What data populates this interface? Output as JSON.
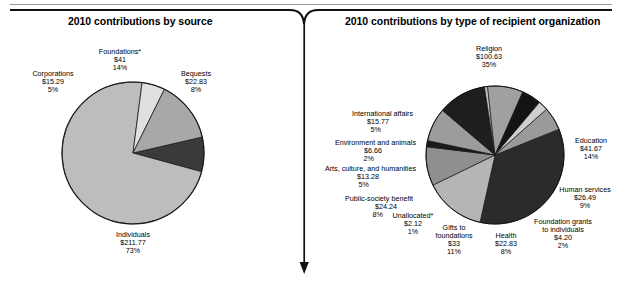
{
  "figure": {
    "divider_arrow": "down-arrow-divider"
  },
  "charts": [
    {
      "id": "contributions-by-source",
      "title": "2010 contributions by source",
      "labels": [
        {
          "name": "foundations",
          "lines": [
            "Foundations*",
            "$41",
            "14%"
          ]
        },
        {
          "name": "bequests",
          "lines": [
            "Bequests",
            "$22.83",
            "8%"
          ]
        },
        {
          "name": "corporations",
          "lines": [
            "Corporations",
            "$15.29",
            "5%"
          ]
        },
        {
          "name": "individuals",
          "lines": [
            "Individuals",
            "$211.77",
            "73%"
          ]
        }
      ]
    },
    {
      "id": "contributions-by-recipient-type",
      "title": "2010 contributions by type of recipient organization",
      "labels": [
        {
          "name": "religion",
          "lines": [
            "Religion",
            "$100.63",
            "35%"
          ]
        },
        {
          "name": "education",
          "lines": [
            "Education",
            "$41.67",
            "14%"
          ]
        },
        {
          "name": "human-services",
          "lines": [
            "Human services",
            "$26.49",
            "9%"
          ]
        },
        {
          "name": "foundation-grants-to-individuals",
          "lines": [
            "Foundation grants",
            "to individuals",
            "$4.20",
            "2%"
          ]
        },
        {
          "name": "health",
          "lines": [
            "Health",
            "$22.83",
            "8%"
          ]
        },
        {
          "name": "gifts-to-foundations",
          "lines": [
            "Gifts to",
            "foundations",
            "$33",
            "11%"
          ]
        },
        {
          "name": "unallocated",
          "lines": [
            "Unallocated*",
            "$2.12",
            "1%"
          ]
        },
        {
          "name": "public-society-benefit",
          "lines": [
            "Public-society benefit",
            "$24.24",
            "8%"
          ]
        },
        {
          "name": "arts-culture-humanities",
          "lines": [
            "Arts, culture, and humanities",
            "$13.28",
            "5%"
          ]
        },
        {
          "name": "environment-and-animals",
          "lines": [
            "Environment and animals",
            "$6.66",
            "2%"
          ]
        },
        {
          "name": "international-affairs",
          "lines": [
            "International affairs",
            "$15.77",
            "5%"
          ]
        }
      ]
    }
  ],
  "chart_data": [
    {
      "type": "pie",
      "title": "2010 contributions by source",
      "units": "billions of dollars",
      "start_angle_deg": -13,
      "direction": "clockwise",
      "categories": [
        "Bequests",
        "Individuals",
        "Corporations",
        "Foundations*"
      ],
      "values": [
        22.83,
        211.77,
        15.29,
        41.0
      ],
      "percents": [
        8,
        73,
        5,
        14
      ],
      "value_labels": [
        "$22.83",
        "$211.77",
        "$15.29",
        "$41"
      ],
      "percent_labels": [
        "8%",
        "73%",
        "5%",
        "14%"
      ],
      "colors": [
        "#3a3a3a",
        "#bdbdbd",
        "#e0e0e0",
        "#a8a8a8"
      ],
      "legend": "none",
      "footnote_marker": "*"
    },
    {
      "type": "pie",
      "title": "2010 contributions by type of recipient organization",
      "units": "billions of dollars",
      "start_angle_deg": -22,
      "direction": "clockwise",
      "categories": [
        "Religion",
        "Education",
        "Human services",
        "Foundation grants to individuals",
        "Health",
        "Gifts to foundations",
        "Unallocated*",
        "Public-society benefit",
        "Arts, culture, and humanities",
        "Environment and animals",
        "International affairs"
      ],
      "values": [
        100.63,
        41.67,
        26.49,
        4.2,
        22.83,
        33.0,
        2.12,
        24.24,
        13.28,
        6.66,
        15.77
      ],
      "percents": [
        35,
        14,
        9,
        2,
        8,
        11,
        1,
        8,
        5,
        2,
        5
      ],
      "value_labels": [
        "$100.63",
        "$41.67",
        "$26.49",
        "$4.20",
        "$22.83",
        "$33",
        "$2.12",
        "$24.24",
        "$13.28",
        "$6.66",
        "$15.77"
      ],
      "percent_labels": [
        "35%",
        "14%",
        "9%",
        "2%",
        "8%",
        "11%",
        "1%",
        "8%",
        "5%",
        "2%",
        "5%"
      ],
      "colors": [
        "#2b2b2b",
        "#b5b5b5",
        "#8f8f8f",
        "#1a1a1a",
        "#9c9c9c",
        "#1e1e1e",
        "#c6c6c6",
        "#a0a0a0",
        "#141414",
        "#cfcfcf",
        "#9a9a9a"
      ],
      "legend": "none",
      "footnote_marker": "*"
    }
  ]
}
